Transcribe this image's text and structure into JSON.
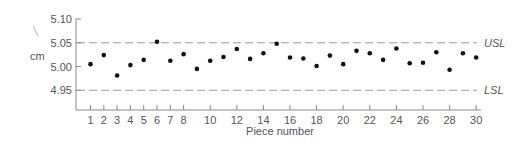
{
  "chart_data": {
    "type": "scatter",
    "title": "",
    "xlabel": "Piece number",
    "ylabel": "cm",
    "xlim": [
      0.5,
      30
    ],
    "ylim": [
      4.9,
      5.1
    ],
    "grid": false,
    "x_ticks": [
      1,
      2,
      3,
      4,
      5,
      6,
      7,
      8,
      10,
      12,
      14,
      16,
      18,
      20,
      22,
      24,
      26,
      28,
      30
    ],
    "x_tick_labels": [
      "1",
      "2",
      "3",
      "4",
      "5",
      "6",
      "7",
      "8",
      "10",
      "12",
      "14",
      "16",
      "18",
      "20",
      "22",
      "24",
      "26",
      "28",
      "30"
    ],
    "y_ticks": [
      5.1,
      5.05,
      5.0,
      4.95
    ],
    "y_tick_labels": [
      "5.10",
      "5.05",
      "5.00",
      "4.95"
    ],
    "reference_lines": [
      {
        "name": "USL",
        "value": 5.05,
        "style": "dashed"
      },
      {
        "name": "LSL",
        "value": 4.95,
        "style": "dashed"
      }
    ],
    "series": [
      {
        "name": "Measurements",
        "x": [
          1,
          2,
          3,
          4,
          5,
          6,
          7,
          8,
          9,
          10,
          11,
          12,
          13,
          14,
          15,
          16,
          17,
          18,
          19,
          20,
          21,
          22,
          23,
          24,
          25,
          26,
          27,
          28,
          29,
          30
        ],
        "values": [
          5.005,
          5.024,
          4.981,
          5.003,
          5.014,
          5.052,
          5.012,
          5.026,
          4.995,
          5.012,
          5.02,
          5.037,
          5.016,
          5.028,
          5.048,
          5.019,
          5.017,
          5.001,
          5.023,
          5.005,
          5.033,
          5.028,
          5.014,
          5.038,
          5.007,
          5.008,
          5.03,
          4.993,
          5.028,
          5.019
        ]
      }
    ]
  },
  "colors": {
    "axis": "#888888",
    "dashed": "#999999",
    "point": "#111111",
    "text": "#555555"
  }
}
